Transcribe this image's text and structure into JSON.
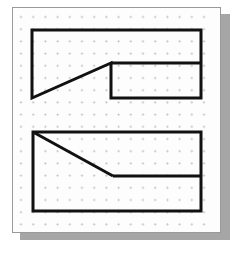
{
  "scene": {
    "title": "Dot-grid worksheet with two outlined polygons",
    "media": "scanned-paper",
    "background_color": "#ffffff",
    "paper_color": "#fdfdfd",
    "paper_border_color": "#9a9a9a",
    "shadow_color": "#a6a6a6",
    "ink_color": "#111111",
    "dot_color": "#c4c4c4"
  },
  "paper": {
    "x": 12,
    "y": 7,
    "width": 209,
    "height": 226,
    "shadow_offset_x": 8,
    "shadow_offset_y": 7
  },
  "grid": {
    "type": "dot-lattice",
    "marker": "plus-tick",
    "spacing_px": 12.2,
    "origin_x": 8,
    "origin_y": 9,
    "columns": 16,
    "rows": 18,
    "dot_radius_px": 0.8,
    "color": "#c4c4c4"
  },
  "figures": [
    {
      "id": "upper-figure",
      "name": "notched-rectangle-upper",
      "description": "Rectangle whose upper-left region is cut by a diagonal that drops from the top-left corner to an interior vertex, forming an internal vertical edge and a step.",
      "stroke_width": 3,
      "stroke_color": "#111111",
      "fill": "none",
      "vertices": [
        [
          19,
          22
        ],
        [
          188,
          22
        ],
        [
          188,
          90
        ],
        [
          98,
          90
        ],
        [
          98,
          55
        ],
        [
          19,
          90
        ]
      ],
      "internal_segments": [
        {
          "name": "step-horizontal",
          "from": [
            98,
            55
          ],
          "to": [
            188,
            55
          ]
        }
      ]
    },
    {
      "id": "lower-figure",
      "name": "notched-rectangle-lower",
      "description": "Rectangle with a diagonal from the top-left corner descending to a horizontal segment that runs to the right edge, cutting off a triangular region.",
      "stroke_width": 3,
      "stroke_color": "#111111",
      "fill": "none",
      "vertices": [
        [
          20,
          124
        ],
        [
          188,
          124
        ],
        [
          188,
          168
        ],
        [
          100,
          168
        ],
        [
          20,
          124
        ]
      ],
      "outer_rect": {
        "x": 20,
        "y": 124,
        "width": 168,
        "height": 79
      },
      "internal_segments": [
        {
          "name": "diagonal",
          "from": [
            20,
            124
          ],
          "to": [
            100,
            168
          ]
        },
        {
          "name": "ledge-horizontal",
          "from": [
            100,
            168
          ],
          "to": [
            188,
            168
          ]
        }
      ]
    }
  ],
  "labels": {
    "text_present": false,
    "items": []
  }
}
